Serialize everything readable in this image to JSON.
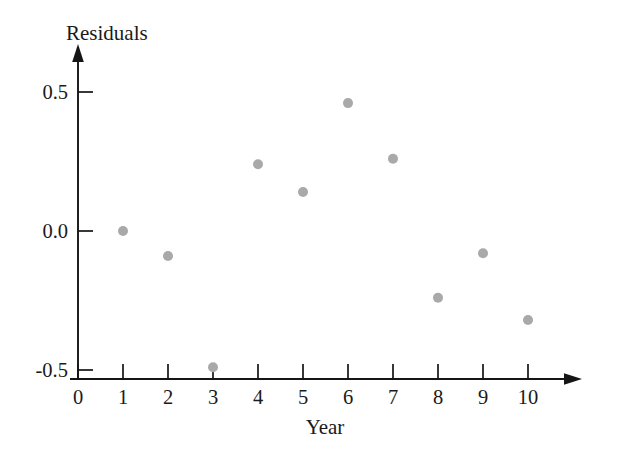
{
  "chart_data": {
    "type": "scatter",
    "title": "",
    "xlabel": "Year",
    "ylabel": "Residuals",
    "x": [
      1,
      2,
      3,
      4,
      5,
      6,
      7,
      8,
      9,
      10
    ],
    "values": [
      0.0,
      -0.09,
      -0.49,
      0.24,
      0.14,
      0.46,
      0.26,
      -0.24,
      -0.08,
      -0.32
    ],
    "series": [
      {
        "name": "Residuals",
        "points": [
          {
            "x": 1,
            "y": 0.0
          },
          {
            "x": 2,
            "y": -0.09
          },
          {
            "x": 3,
            "y": -0.49
          },
          {
            "x": 4,
            "y": 0.24
          },
          {
            "x": 5,
            "y": 0.14
          },
          {
            "x": 6,
            "y": 0.46
          },
          {
            "x": 7,
            "y": 0.26
          },
          {
            "x": 8,
            "y": -0.24
          },
          {
            "x": 9,
            "y": -0.08
          },
          {
            "x": 10,
            "y": -0.32
          }
        ],
        "marker_color": "#a9a9a9",
        "marker_size": 10
      }
    ],
    "xticks": [
      0,
      1,
      2,
      3,
      4,
      5,
      6,
      7,
      8,
      9,
      10
    ],
    "xtick_labels": [
      "0",
      "1",
      "2",
      "3",
      "4",
      "5",
      "6",
      "7",
      "8",
      "9",
      "10"
    ],
    "yticks": [
      -0.5,
      0.0,
      0.5
    ],
    "ytick_labels": [
      "-0.5",
      "0.0",
      "0.5"
    ],
    "xlim": [
      0,
      10
    ],
    "ylim": [
      -0.5,
      0.5
    ],
    "grid": false,
    "legend": "none",
    "axis_color": "#151515",
    "text_color": "#1a1a1a",
    "background": "#ffffff",
    "axis_arrows": true
  },
  "labels": {
    "y_axis_title": "Residuals",
    "x_axis_title": "Year"
  }
}
